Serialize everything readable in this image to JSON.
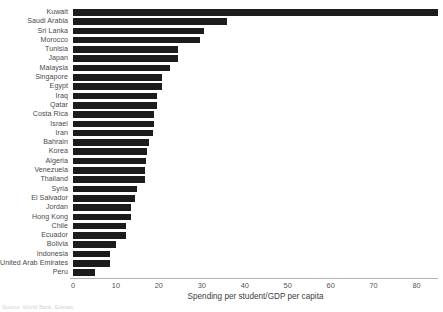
{
  "chart_data": {
    "type": "bar",
    "orientation": "horizontal",
    "title": "",
    "xlabel": "Spending per student/GDP per capita",
    "ylabel": "",
    "xlim": [
      0,
      85
    ],
    "xticks": [
      0,
      10,
      20,
      30,
      40,
      50,
      60,
      70,
      80
    ],
    "grid": false,
    "legend": null,
    "bar_color": "#1c1c1c",
    "axis_color": "#b4b4b4",
    "categories": [
      "Kuwait",
      "Saudi Arabia",
      "Sri Lanka",
      "Morocco",
      "Tunisia",
      "Japan",
      "Malaysia",
      "Singapore",
      "Egypt",
      "Iraq",
      "Qatar",
      "Costa Rica",
      "Israel",
      "Iran",
      "Bahrain",
      "Korea",
      "Algeria",
      "Venezuela",
      "Thailand",
      "Syria",
      "El Salvador",
      "Jordan",
      "Hong Kong",
      "Chile",
      "Ecuador",
      "Bolivia",
      "Indonesia",
      "United Arab Emirates",
      "Peru"
    ],
    "values": [
      85.0,
      35.8,
      30.6,
      29.6,
      24.5,
      24.5,
      22.6,
      20.8,
      20.8,
      19.6,
      19.6,
      18.9,
      18.9,
      18.6,
      17.6,
      17.3,
      16.9,
      16.7,
      16.7,
      15.0,
      14.5,
      13.5,
      13.5,
      12.4,
      12.4,
      9.9,
      8.7,
      8.7,
      5.2
    ]
  },
  "axis": {
    "tick_labels": [
      "0",
      "10",
      "20",
      "30",
      "40",
      "50",
      "60",
      "70",
      "80"
    ],
    "title": "Spending per student/GDP per capita"
  },
  "footer": {
    "source": "Source: World Bank, Edstats"
  }
}
